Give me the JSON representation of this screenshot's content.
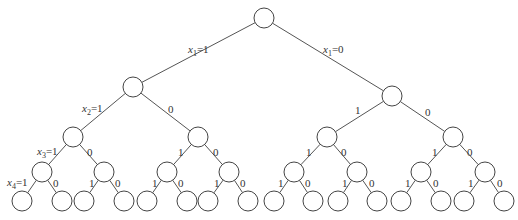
{
  "diagram": {
    "type": "binary-tree",
    "node_radius": 10,
    "nodes": [
      {
        "id": "n0",
        "x": 264,
        "y": 18
      },
      {
        "id": "n1",
        "x": 133,
        "y": 87
      },
      {
        "id": "n2",
        "x": 392,
        "y": 96
      },
      {
        "id": "n3",
        "x": 73,
        "y": 137
      },
      {
        "id": "n4",
        "x": 198,
        "y": 137
      },
      {
        "id": "n5",
        "x": 327,
        "y": 137
      },
      {
        "id": "n6",
        "x": 453,
        "y": 137
      },
      {
        "id": "n7",
        "x": 42,
        "y": 172
      },
      {
        "id": "n8",
        "x": 104,
        "y": 172
      },
      {
        "id": "n9",
        "x": 167,
        "y": 172
      },
      {
        "id": "n10",
        "x": 229,
        "y": 172
      },
      {
        "id": "n11",
        "x": 294,
        "y": 172
      },
      {
        "id": "n12",
        "x": 357,
        "y": 172
      },
      {
        "id": "n13",
        "x": 421,
        "y": 172
      },
      {
        "id": "n14",
        "x": 485,
        "y": 172
      },
      {
        "id": "n15",
        "x": 22,
        "y": 201
      },
      {
        "id": "n16",
        "x": 62,
        "y": 201
      },
      {
        "id": "n17",
        "x": 84,
        "y": 201
      },
      {
        "id": "n18",
        "x": 124,
        "y": 201
      },
      {
        "id": "n19",
        "x": 147,
        "y": 201
      },
      {
        "id": "n20",
        "x": 187,
        "y": 201
      },
      {
        "id": "n21",
        "x": 208,
        "y": 201
      },
      {
        "id": "n22",
        "x": 248,
        "y": 201
      },
      {
        "id": "n23",
        "x": 274,
        "y": 201
      },
      {
        "id": "n24",
        "x": 313,
        "y": 201
      },
      {
        "id": "n25",
        "x": 338,
        "y": 201
      },
      {
        "id": "n26",
        "x": 377,
        "y": 201
      },
      {
        "id": "n27",
        "x": 401,
        "y": 201
      },
      {
        "id": "n28",
        "x": 441,
        "y": 201
      },
      {
        "id": "n29",
        "x": 464,
        "y": 201
      },
      {
        "id": "n30",
        "x": 504,
        "y": 201
      }
    ],
    "edges": [
      {
        "from": 0,
        "to": 1
      },
      {
        "from": 0,
        "to": 2
      },
      {
        "from": 1,
        "to": 3
      },
      {
        "from": 1,
        "to": 4
      },
      {
        "from": 2,
        "to": 5
      },
      {
        "from": 2,
        "to": 6
      },
      {
        "from": 3,
        "to": 7
      },
      {
        "from": 3,
        "to": 8
      },
      {
        "from": 4,
        "to": 9
      },
      {
        "from": 4,
        "to": 10
      },
      {
        "from": 5,
        "to": 11
      },
      {
        "from": 5,
        "to": 12
      },
      {
        "from": 6,
        "to": 13
      },
      {
        "from": 6,
        "to": 14
      },
      {
        "from": 7,
        "to": 15
      },
      {
        "from": 7,
        "to": 16
      },
      {
        "from": 8,
        "to": 17
      },
      {
        "from": 8,
        "to": 18
      },
      {
        "from": 9,
        "to": 19
      },
      {
        "from": 9,
        "to": 20
      },
      {
        "from": 10,
        "to": 21
      },
      {
        "from": 10,
        "to": 22
      },
      {
        "from": 11,
        "to": 23
      },
      {
        "from": 11,
        "to": 24
      },
      {
        "from": 12,
        "to": 25
      },
      {
        "from": 12,
        "to": 26
      },
      {
        "from": 13,
        "to": 27
      },
      {
        "from": 13,
        "to": 28
      },
      {
        "from": 14,
        "to": 29
      },
      {
        "from": 14,
        "to": 30
      }
    ],
    "labels": {
      "x1_eq_1": {
        "var": "x",
        "sub": "1",
        "val": "=1"
      },
      "x1_eq_0": {
        "var": "x",
        "sub": "1",
        "val": "=0"
      },
      "x2_eq_1": {
        "var": "x",
        "sub": "2",
        "val": "=1"
      },
      "x3_eq_1": {
        "var": "x",
        "sub": "3",
        "val": "=1"
      },
      "x4_eq_1": {
        "var": "x",
        "sub": "4",
        "val": "=1"
      },
      "one": "1",
      "zero": "0"
    }
  }
}
